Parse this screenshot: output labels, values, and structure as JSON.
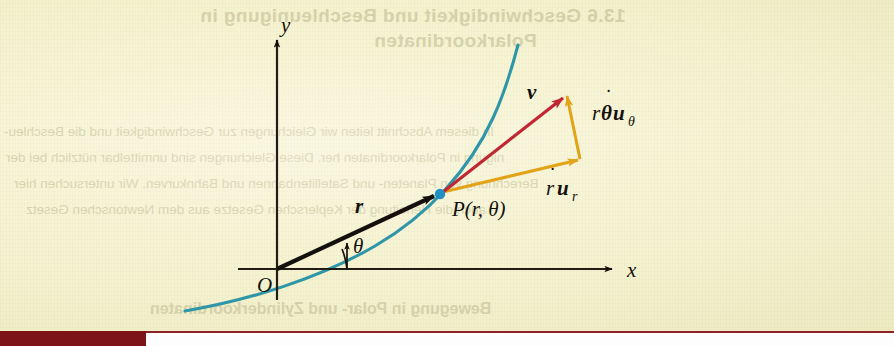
{
  "figure": {
    "kind": "math-diagram",
    "background_color": "#f7f4d0",
    "axes": {
      "x_label": "x",
      "y_label": "y",
      "origin_label": "O",
      "axis_color": "#211d14"
    },
    "curve": {
      "name": "path-of-particle",
      "color": "#2f96a8"
    },
    "point": {
      "label": "P(r, θ)",
      "marker_color": "#1f8fc4"
    },
    "angle": {
      "label": "θ"
    },
    "vectors": [
      {
        "name": "position-vector-r",
        "label": "r",
        "color": "#14110c"
      },
      {
        "name": "velocity-vector-v",
        "label": "v",
        "color": "#c02733"
      },
      {
        "name": "radial-component",
        "label_base": "r",
        "label_dot": "˙",
        "label_unit": "u",
        "label_sub": "r",
        "color": "#e2a317"
      },
      {
        "name": "transverse-component",
        "label_r": "r",
        "label_theta": "θ",
        "label_dot": "˙",
        "label_unit": "u",
        "label_sub": "θ",
        "color": "#e2a317"
      }
    ]
  },
  "showthrough": {
    "note": "faint mirrored text bleeding through from the reverse side of the printed page",
    "heading_line_1": "13.6  Geschwindigkeit und Beschleunigung in",
    "heading_line_2": "Polarkoordinaten",
    "body_line_1": "In diesem Abschnitt leiten wir Gleichungen zur Geschwindigkeit und die Beschleu-",
    "body_line_2": "nigung in Polarkoordinaten her. Diese Gleichungen sind unmittelbar nützlich bei der",
    "body_line_3": "Berechnung von Planeten- und Satellitenbahnen und Bahnkurven. Wir untersuchen hier",
    "body_line_4": "auch die Herleitung der Keplerschen Gesetze aus dem Newtonschen Gesetz",
    "heading_line_3": "Bewegung in Polar- und Zylinderkoordinaten"
  },
  "chrome": {
    "red_bar_color": "#7d1418",
    "bottom_strip_color": "#fdfdfd"
  }
}
